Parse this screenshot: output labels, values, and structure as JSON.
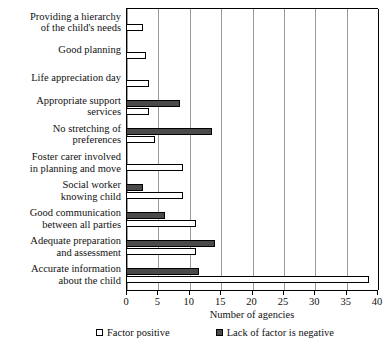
{
  "chart_data": {
    "type": "bar",
    "orientation": "horizontal",
    "title": "",
    "xlabel": "Number of agencies",
    "ylabel": "",
    "xlim": [
      0,
      40
    ],
    "xticks": [
      0,
      5,
      10,
      15,
      20,
      25,
      30,
      35,
      40
    ],
    "grid": true,
    "legend_position": "bottom",
    "categories": [
      "Providing a hierarchy of the child's needs",
      "Good planning",
      "Life appreciation day",
      "Appropriate support services",
      "No stretching of preferences",
      "Foster carer involved in planning and move",
      "Social worker knowing child",
      "Good communication between all parties",
      "Adequate preparation and assessment",
      "Accurate information about the child"
    ],
    "category_lines": [
      [
        "Providing a hierarchy",
        "of the child's needs"
      ],
      [
        "Good planning"
      ],
      [
        "Life appreciation day"
      ],
      [
        "Appropriate support",
        "services"
      ],
      [
        "No stretching of",
        "preferences"
      ],
      [
        "Foster carer involved",
        "in planning and move"
      ],
      [
        "Social worker",
        "knowing child"
      ],
      [
        "Good communication",
        "between all parties"
      ],
      [
        "Adequate preparation",
        "and assessment"
      ],
      [
        "Accurate information",
        "about the child"
      ]
    ],
    "series": [
      {
        "name": "Lack of factor is negative",
        "color": "#4a4a4a",
        "values": [
          0,
          0,
          0,
          8.5,
          13.5,
          0,
          2.5,
          6,
          14,
          11.5
        ]
      },
      {
        "name": "Factor positive",
        "color": "#ffffff",
        "values": [
          2.5,
          3,
          3.5,
          3.5,
          4.5,
          9,
          9,
          11,
          11,
          38.5
        ]
      }
    ],
    "legend": [
      {
        "label": "Factor positive",
        "swatch": "positive"
      },
      {
        "label": "Lack of factor is negative",
        "swatch": "negative"
      }
    ]
  }
}
